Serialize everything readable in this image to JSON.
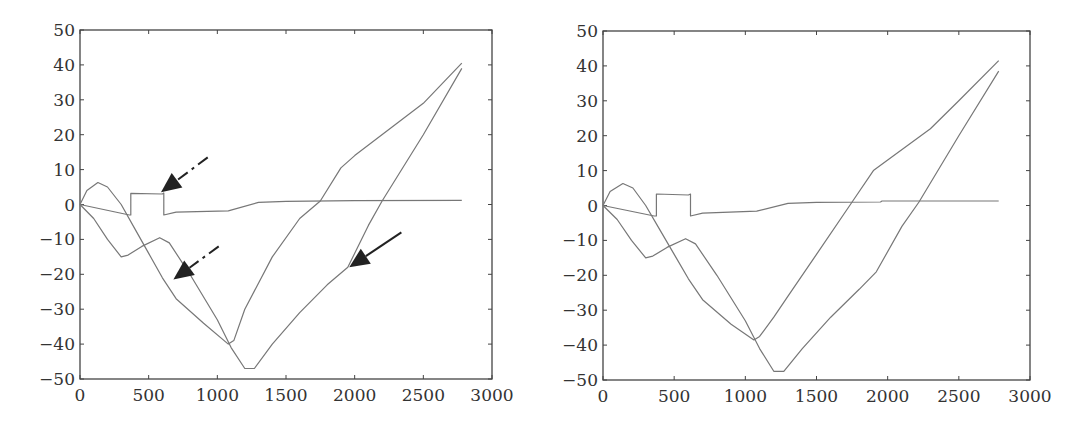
{
  "chart_data": [
    {
      "type": "line",
      "title": "",
      "xlabel": "",
      "ylabel": "",
      "xlim": [
        0,
        3000
      ],
      "ylim": [
        -50,
        50
      ],
      "xticks": [
        0,
        500,
        1000,
        1500,
        2000,
        2500,
        3000
      ],
      "yticks": [
        -50,
        -40,
        -30,
        -20,
        -10,
        0,
        10,
        20,
        30,
        40,
        50
      ],
      "grid": false,
      "legend": null,
      "series": [
        {
          "name": "curve-a",
          "points": [
            [
              0,
              0
            ],
            [
              50,
              4
            ],
            [
              130,
              6.3
            ],
            [
              200,
              5
            ],
            [
              300,
              0
            ],
            [
              400,
              -7
            ],
            [
              500,
              -14
            ],
            [
              600,
              -21
            ],
            [
              700,
              -27
            ],
            [
              900,
              -34
            ],
            [
              1080,
              -40
            ],
            [
              1120,
              -39
            ],
            [
              1200,
              -30
            ],
            [
              1400,
              -15
            ],
            [
              1600,
              -4
            ],
            [
              1750,
              1
            ],
            [
              1900,
              10.5
            ],
            [
              2000,
              14
            ],
            [
              2500,
              29
            ],
            [
              2780,
              40.5
            ]
          ]
        },
        {
          "name": "curve-b",
          "points": [
            [
              0,
              0
            ],
            [
              100,
              -4
            ],
            [
              200,
              -10
            ],
            [
              300,
              -15
            ],
            [
              350,
              -14.5
            ],
            [
              450,
              -12
            ],
            [
              580,
              -9.5
            ],
            [
              650,
              -11
            ],
            [
              800,
              -20
            ],
            [
              1000,
              -33
            ],
            [
              1100,
              -41
            ],
            [
              1200,
              -47
            ],
            [
              1270,
              -47
            ],
            [
              1400,
              -40
            ],
            [
              1600,
              -31
            ],
            [
              1800,
              -23
            ],
            [
              1950,
              -18
            ],
            [
              2100,
              -6
            ],
            [
              2200,
              1
            ],
            [
              2500,
              20
            ],
            [
              2780,
              39
            ]
          ]
        },
        {
          "name": "curve-c",
          "points": [
            [
              0,
              0
            ],
            [
              360,
              -3
            ],
            [
              370,
              -3
            ],
            [
              370,
              3.2
            ],
            [
              600,
              3
            ],
            [
              610,
              3.3
            ],
            [
              610,
              -3
            ],
            [
              700,
              -2.2
            ],
            [
              1080,
              -1.8
            ],
            [
              1300,
              0.6
            ],
            [
              1500,
              0.9
            ],
            [
              2000,
              1.1
            ],
            [
              2780,
              1.2
            ]
          ]
        }
      ],
      "annotations": [
        {
          "type": "arrow",
          "style": "dash-dot",
          "from": [
            930,
            13.5
          ],
          "to": [
            590,
            3.5
          ]
        },
        {
          "type": "arrow",
          "style": "dash-dot",
          "from": [
            1010,
            -12
          ],
          "to": [
            680,
            -21.5
          ]
        },
        {
          "type": "arrow",
          "style": "solid",
          "from": [
            2340,
            -8
          ],
          "to": [
            1960,
            -18
          ]
        }
      ]
    },
    {
      "type": "line",
      "title": "",
      "xlabel": "",
      "ylabel": "",
      "xlim": [
        0,
        3000
      ],
      "ylim": [
        -50,
        50
      ],
      "xticks": [
        0,
        500,
        1000,
        1500,
        2000,
        2500,
        3000
      ],
      "yticks": [
        -50,
        -40,
        -30,
        -20,
        -10,
        0,
        10,
        20,
        30,
        40,
        50
      ],
      "grid": false,
      "legend": null,
      "series": [
        {
          "name": "curve-a",
          "points": [
            [
              0,
              0
            ],
            [
              50,
              4
            ],
            [
              140,
              6.3
            ],
            [
              210,
              5
            ],
            [
              300,
              0
            ],
            [
              400,
              -7
            ],
            [
              500,
              -14
            ],
            [
              600,
              -21
            ],
            [
              700,
              -27
            ],
            [
              900,
              -34
            ],
            [
              1060,
              -38.5
            ],
            [
              1100,
              -37.5
            ],
            [
              1200,
              -32
            ],
            [
              1300,
              -26
            ],
            [
              1500,
              -14
            ],
            [
              1750,
              1
            ],
            [
              1900,
              10
            ],
            [
              2000,
              13
            ],
            [
              2300,
              22
            ],
            [
              2500,
              30
            ],
            [
              2780,
              41.5
            ]
          ]
        },
        {
          "name": "curve-b",
          "points": [
            [
              0,
              0
            ],
            [
              100,
              -4
            ],
            [
              200,
              -10
            ],
            [
              300,
              -15
            ],
            [
              350,
              -14.5
            ],
            [
              450,
              -12
            ],
            [
              580,
              -9.5
            ],
            [
              650,
              -11
            ],
            [
              800,
              -20
            ],
            [
              1000,
              -33
            ],
            [
              1100,
              -41
            ],
            [
              1200,
              -47.5
            ],
            [
              1270,
              -47.5
            ],
            [
              1400,
              -41
            ],
            [
              1600,
              -32
            ],
            [
              1800,
              -24
            ],
            [
              1920,
              -19
            ],
            [
              2100,
              -6
            ],
            [
              2220,
              1
            ],
            [
              2500,
              20
            ],
            [
              2780,
              38.5
            ]
          ]
        },
        {
          "name": "curve-c",
          "points": [
            [
              0,
              0
            ],
            [
              360,
              -3
            ],
            [
              375,
              -3
            ],
            [
              375,
              3.3
            ],
            [
              600,
              3
            ],
            [
              615,
              3.3
            ],
            [
              615,
              -3
            ],
            [
              700,
              -2.2
            ],
            [
              1080,
              -1.6
            ],
            [
              1300,
              0.6
            ],
            [
              1500,
              0.9
            ],
            [
              1950,
              1.0
            ],
            [
              1960,
              1.3
            ],
            [
              2780,
              1.3
            ]
          ]
        }
      ],
      "annotations": []
    }
  ],
  "panels": [
    {
      "name": "left-plot",
      "x_offset": 0,
      "plot_box": {
        "left": 80,
        "top": 30,
        "right": 492,
        "bottom": 379
      }
    },
    {
      "name": "right-plot",
      "x_offset": 0,
      "plot_box": {
        "left": 603,
        "top": 31,
        "right": 1030,
        "bottom": 380
      }
    }
  ],
  "colors": {
    "line": "#777777",
    "axis": "#444444",
    "arrow": "#222222",
    "text": "#333333"
  }
}
